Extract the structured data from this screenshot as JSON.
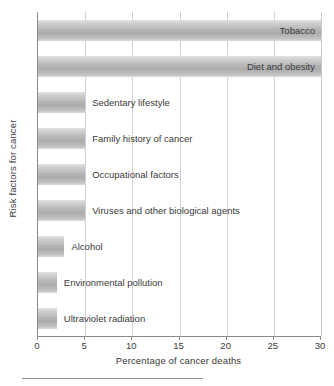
{
  "chart_data": {
    "type": "bar",
    "orientation": "horizontal",
    "title": "",
    "xlabel": "Percentage of cancer deaths",
    "ylabel": "Risk factors for cancer",
    "xlim": [
      0,
      30
    ],
    "xticks": [
      0,
      5,
      10,
      15,
      20,
      25,
      30
    ],
    "xtick_labels": [
      "0",
      "5",
      "10",
      "15",
      "20",
      "25",
      "30"
    ],
    "grid": "vertical",
    "legend": "none",
    "categories": [
      "Tobacco",
      "Diet and obesity",
      "Sedentary lifestyle",
      "Family history of cancer",
      "Occupational factors",
      "Viruses and other biological agents",
      "Alcohol",
      "Environmental pollution",
      "Ultraviolet radiation"
    ],
    "values": [
      30,
      30,
      5,
      5,
      5,
      5,
      2.8,
      2,
      2
    ],
    "label_placement": [
      "inside",
      "inside",
      "outside",
      "outside",
      "outside",
      "outside",
      "outside",
      "outside",
      "outside"
    ],
    "bar_color": "#b4b4b4"
  },
  "axes": {
    "x_title": "Percentage of cancer deaths",
    "y_title": "Risk factors for cancer",
    "tick_labels": [
      "0",
      "5",
      "10",
      "15",
      "20",
      "25",
      "30"
    ]
  }
}
